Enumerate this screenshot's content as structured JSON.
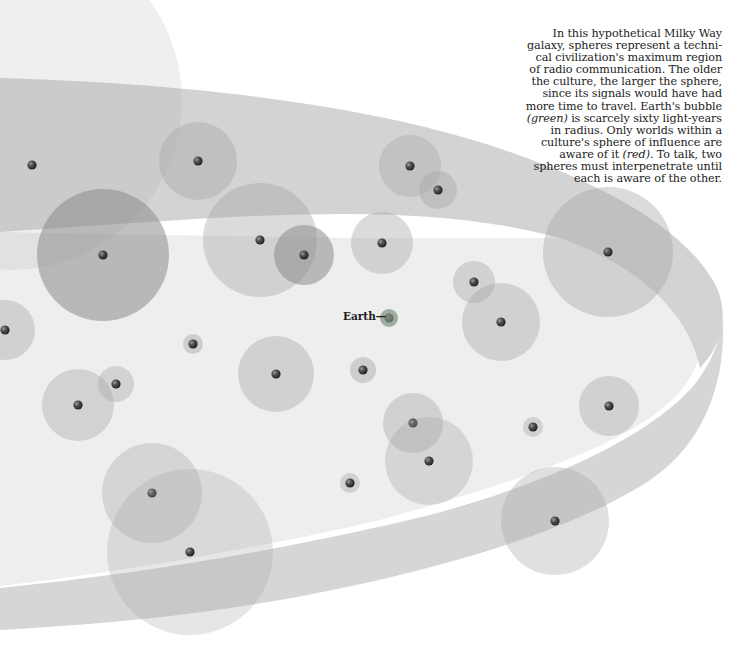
{
  "figure": {
    "type": "galaxy-civilization-spheres",
    "colors": {
      "background": "#ffffff",
      "band": "#d9d9d9",
      "band_top": "#cfcfcf",
      "sphere_fill": "#a6a6a6",
      "sphere_dark": "#8c8c8c",
      "star": "#3a3a3a",
      "earth_sphere": "#9aa59a",
      "text": "#1c1c1c"
    },
    "earth": {
      "label": "Earth",
      "connector": "—",
      "x": 389,
      "y": 318,
      "r": 9
    },
    "caption": {
      "lines": [
        [
          {
            "t": "In this hypothetical Milky Way"
          }
        ],
        [
          {
            "t": "galaxy, spheres represent a techni-"
          }
        ],
        [
          {
            "t": "cal civilization's maximum region"
          }
        ],
        [
          {
            "t": "of radio communication. The older"
          }
        ],
        [
          {
            "t": "the culture, the larger the sphere,"
          }
        ],
        [
          {
            "t": "since its signals would have had"
          }
        ],
        [
          {
            "t": "more time to travel. Earth's bubble"
          }
        ],
        [
          {
            "t": "(green)",
            "i": true
          },
          {
            "t": " is scarcely sixty light-years"
          }
        ],
        [
          {
            "t": "in radius. Only worlds within a"
          }
        ],
        [
          {
            "t": "culture's sphere of influence are"
          }
        ],
        [
          {
            "t": "aware of it "
          },
          {
            "t": "(red)",
            "i": true
          },
          {
            "t": ". To talk, two"
          }
        ],
        [
          {
            "t": "spheres must interpenetrate until"
          }
        ],
        [
          {
            "t": "each is aware of the other."
          }
        ]
      ]
    },
    "spheres": [
      {
        "x": 12,
        "y": 100,
        "r": 170,
        "o": 0.18,
        "star": false
      },
      {
        "x": 32,
        "y": 165,
        "r": 0,
        "o": 0,
        "star": true
      },
      {
        "x": 198,
        "y": 161,
        "r": 39,
        "o": 0.42,
        "star": true
      },
      {
        "x": 103,
        "y": 255,
        "r": 66,
        "o": 0.55,
        "star": true,
        "dark": true
      },
      {
        "x": 260,
        "y": 240,
        "r": 57,
        "o": 0.4,
        "star": true
      },
      {
        "x": 304,
        "y": 255,
        "r": 30,
        "o": 0.55,
        "star": true,
        "dark": true
      },
      {
        "x": 382,
        "y": 243,
        "r": 31,
        "o": 0.4,
        "star": true
      },
      {
        "x": 410,
        "y": 166,
        "r": 31,
        "o": 0.38,
        "star": true
      },
      {
        "x": 438,
        "y": 190,
        "r": 19,
        "o": 0.4,
        "star": true
      },
      {
        "x": 474,
        "y": 282,
        "r": 21,
        "o": 0.4,
        "star": true
      },
      {
        "x": 501,
        "y": 322,
        "r": 39,
        "o": 0.4,
        "star": true
      },
      {
        "x": 608,
        "y": 252,
        "r": 65,
        "o": 0.4,
        "star": true
      },
      {
        "x": 5,
        "y": 330,
        "r": 30,
        "o": 0.4,
        "star": true
      },
      {
        "x": 193,
        "y": 344,
        "r": 10,
        "o": 0.45,
        "star": true
      },
      {
        "x": 276,
        "y": 374,
        "r": 38,
        "o": 0.4,
        "star": true
      },
      {
        "x": 363,
        "y": 370,
        "r": 13,
        "o": 0.45,
        "star": true
      },
      {
        "x": 116,
        "y": 384,
        "r": 18,
        "o": 0.38,
        "star": true
      },
      {
        "x": 78,
        "y": 405,
        "r": 36,
        "o": 0.38,
        "star": true
      },
      {
        "x": 413,
        "y": 423,
        "r": 30,
        "o": 0.4,
        "star": true
      },
      {
        "x": 429,
        "y": 461,
        "r": 44,
        "o": 0.35,
        "star": true
      },
      {
        "x": 533,
        "y": 427,
        "r": 10,
        "o": 0.4,
        "star": true
      },
      {
        "x": 609,
        "y": 406,
        "r": 30,
        "o": 0.4,
        "star": true
      },
      {
        "x": 152,
        "y": 493,
        "r": 50,
        "o": 0.35,
        "star": true
      },
      {
        "x": 190,
        "y": 552,
        "r": 83,
        "o": 0.28,
        "star": true
      },
      {
        "x": 350,
        "y": 483,
        "r": 10,
        "o": 0.4,
        "star": true
      },
      {
        "x": 555,
        "y": 521,
        "r": 54,
        "o": 0.35,
        "star": true
      }
    ],
    "overlaps": [
      {
        "a": 3,
        "b": 0,
        "note": "large sphere partially aware"
      },
      {
        "a": 4,
        "b": 5,
        "note": "two spheres interpenetrate"
      },
      {
        "a": 18,
        "b": 19,
        "note": "two spheres interpenetrate"
      },
      {
        "a": 22,
        "b": 23,
        "note": "two spheres interpenetrate"
      }
    ]
  }
}
